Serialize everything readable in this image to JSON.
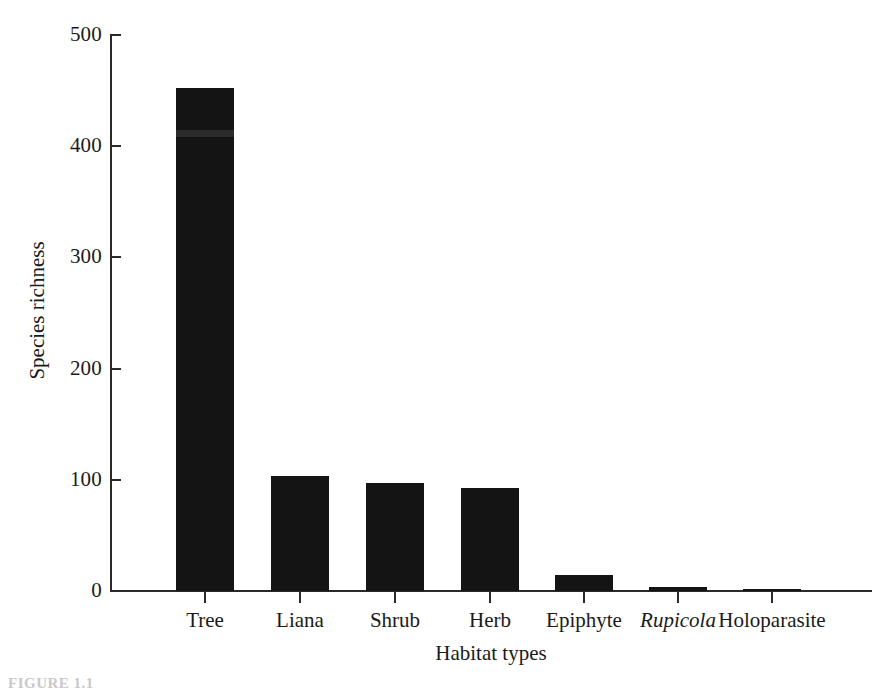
{
  "figure": {
    "caption": "FIGURE 1.1"
  },
  "chart_data": {
    "type": "bar",
    "title": "",
    "xlabel": "Habitat types",
    "ylabel": "Species richness",
    "categories": [
      "Tree",
      "Liana",
      "Shrub",
      "Herb",
      "Epiphyte",
      "Rupicola",
      "Holoparasite"
    ],
    "category_styles": [
      "normal",
      "normal",
      "normal",
      "normal",
      "normal",
      "italic",
      "normal"
    ],
    "values": [
      452,
      103,
      97,
      93,
      14,
      4,
      1
    ],
    "ylim": [
      0,
      500
    ],
    "yticks": [
      0,
      100,
      200,
      300,
      400,
      500
    ],
    "ytick_labels": [
      "0",
      "100",
      "200",
      "300",
      "400",
      "500"
    ],
    "grid": false,
    "legend": false,
    "bar_color": "#141414"
  }
}
